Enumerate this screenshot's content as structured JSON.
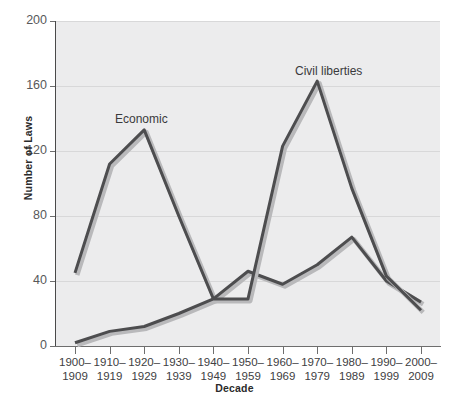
{
  "chart_data": {
    "type": "line",
    "title": "",
    "xlabel": "Decade",
    "ylabel": "Number of Laws",
    "ylim": [
      0,
      200
    ],
    "yticks": [
      0,
      40,
      80,
      120,
      160,
      200
    ],
    "grid": true,
    "legend_position": "inline-annotations",
    "categories": [
      "1900–\n1909",
      "1910–\n1919",
      "1920–\n1929",
      "1930–\n1939",
      "1940–\n1949",
      "1950–\n1959",
      "1960–\n1969",
      "1970–\n1979",
      "1980–\n1989",
      "1990–\n1999",
      "2000–\n2009"
    ],
    "category_labels": [
      {
        "top": "1900–",
        "bottom": "1909"
      },
      {
        "top": "1910–",
        "bottom": "1919"
      },
      {
        "top": "1920–",
        "bottom": "1929"
      },
      {
        "top": "1930–",
        "bottom": "1939"
      },
      {
        "top": "1940–",
        "bottom": "1949"
      },
      {
        "top": "1950–",
        "bottom": "1959"
      },
      {
        "top": "1960–",
        "bottom": "1969"
      },
      {
        "top": "1970–",
        "bottom": "1979"
      },
      {
        "top": "1980–",
        "bottom": "1989"
      },
      {
        "top": "1990–",
        "bottom": "1999"
      },
      {
        "top": "2000–",
        "bottom": "2009"
      }
    ],
    "series": [
      {
        "name": "Economic",
        "annotation": "Economic",
        "color": "#4d4d4f",
        "values": [
          45,
          112,
          133,
          80,
          29,
          46,
          38,
          50,
          67,
          40,
          27
        ]
      },
      {
        "name": "Civil liberties",
        "annotation": "Civil liberties",
        "color": "#4d4d4f",
        "values": [
          2,
          9,
          12,
          20,
          29,
          29,
          123,
          163,
          97,
          43,
          22
        ]
      }
    ]
  },
  "axes": {
    "y_axis_title": "Number of Laws",
    "x_axis_title": "Decade",
    "y_tick_labels": [
      "0",
      "40",
      "80",
      "120",
      "160",
      "200"
    ]
  },
  "annotations": {
    "economic": "Economic",
    "civil_liberties": "Civil liberties"
  },
  "colors": {
    "plot_background": "#ececed",
    "gridline": "#d8d8d9",
    "line": "#4d4d4f",
    "axis": "#6e6e6e",
    "text": "#404042"
  }
}
